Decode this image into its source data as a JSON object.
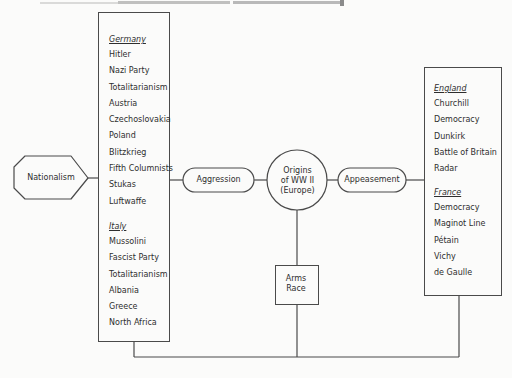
{
  "nodes": {
    "nationalism": {
      "label": "Nationalism"
    },
    "aggression": {
      "label": "Aggression"
    },
    "appeasement": {
      "label": "Appeasement"
    },
    "origins": {
      "lines": [
        "Origins",
        "of WW II",
        "(Europe)"
      ]
    },
    "arms_race": {
      "lines": [
        "Arms",
        "Race"
      ]
    }
  },
  "left_box": {
    "sections": [
      {
        "header": "Germany",
        "items": [
          "Hitler",
          "Nazi Party",
          "Totalitarianism",
          "Austria",
          "Czechoslovakia",
          "Poland",
          "Blitzkrieg",
          "Fifth Columnists",
          "Stukas",
          "Luftwaffe"
        ]
      },
      {
        "header": "Italy",
        "items": [
          "Mussolini",
          "Fascist Party",
          "Totalitarianism",
          "Albania",
          "Greece",
          "North Africa"
        ]
      }
    ]
  },
  "right_box": {
    "sections": [
      {
        "header": "England",
        "items": [
          "Churchill",
          "Democracy",
          "Dunkirk",
          "Battle of Britain",
          "Radar"
        ]
      },
      {
        "header": "France",
        "items": [
          "Democracy",
          "Maginot Line",
          "Pétain",
          "Vichy",
          "de Gaulle"
        ]
      }
    ]
  },
  "colors": {
    "line": "#4a4a4a",
    "text": "#2e2e2e",
    "background": "#fbfbfa"
  }
}
